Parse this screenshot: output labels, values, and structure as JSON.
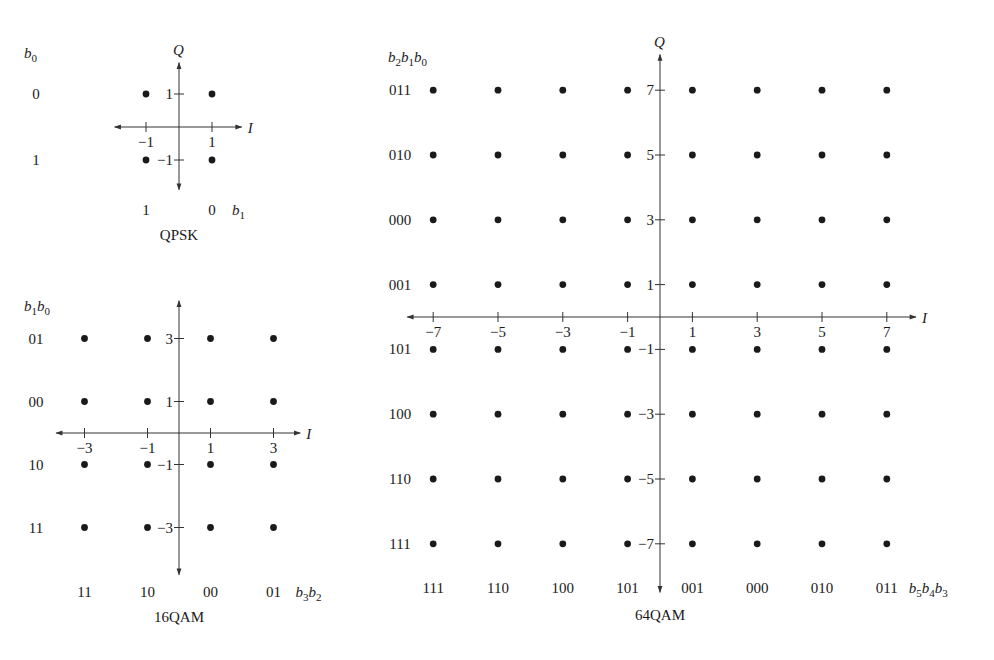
{
  "diagrams": [
    {
      "id": "qpsk",
      "title": "QPSK",
      "origin": [
        179,
        127
      ],
      "unit": 33,
      "x_range": [
        -1.95,
        1.9
      ],
      "y_range": [
        -1.9,
        1.95
      ],
      "x_axis_label": "I",
      "y_axis_label": "Q",
      "x_ticks": [
        -1,
        1
      ],
      "y_ticks": [
        1,
        -1
      ],
      "levels": [
        -1,
        1
      ],
      "row_header": "b0",
      "row_labels": [
        {
          "y": 1,
          "text": "0"
        },
        {
          "y": -1,
          "text": "1"
        }
      ],
      "row_label_x": 36,
      "col_header": "b1",
      "col_labels": [
        {
          "x": -1,
          "text": "1"
        },
        {
          "x": 1,
          "text": "0"
        }
      ],
      "col_label_y": 215,
      "title_y": 240
    },
    {
      "id": "16qam",
      "title": "16QAM",
      "origin": [
        179,
        433
      ],
      "unit": 31.5,
      "x_range": [
        -3.9,
        3.85
      ],
      "y_range": [
        -4.5,
        4.2
      ],
      "x_axis_label": "I",
      "y_axis_label": "",
      "x_ticks": [
        -3,
        -1,
        1,
        3
      ],
      "y_ticks": [
        3,
        1,
        -1,
        -3
      ],
      "levels": [
        -3,
        -1,
        1,
        3
      ],
      "row_header": "b1b0",
      "row_labels": [
        {
          "y": 3,
          "text": "01"
        },
        {
          "y": 1,
          "text": "00"
        },
        {
          "y": -1,
          "text": "10"
        },
        {
          "y": -3,
          "text": "11"
        }
      ],
      "row_label_x": 36,
      "col_header": "b3b2",
      "col_labels": [
        {
          "x": -3,
          "text": "11"
        },
        {
          "x": -1,
          "text": "10"
        },
        {
          "x": 1,
          "text": "00"
        },
        {
          "x": 3,
          "text": "01"
        }
      ],
      "col_label_y": 597,
      "title_y": 622
    },
    {
      "id": "64qam",
      "title": "64QAM",
      "origin": [
        660,
        317
      ],
      "unit": 32.4,
      "x_range": [
        -7.8,
        7.9
      ],
      "y_range": [
        -8.5,
        8.1
      ],
      "x_axis_label": "I",
      "y_axis_label": "Q",
      "x_ticks": [
        -7,
        -5,
        -3,
        -1,
        1,
        3,
        5,
        7
      ],
      "y_ticks": [
        7,
        5,
        3,
        1,
        -1,
        -3,
        -5,
        -7
      ],
      "levels": [
        -7,
        -5,
        -3,
        -1,
        1,
        3,
        5,
        7
      ],
      "row_header": "b2b1b0",
      "row_labels": [
        {
          "y": 7,
          "text": "011"
        },
        {
          "y": 5,
          "text": "010"
        },
        {
          "y": 3,
          "text": "000"
        },
        {
          "y": 1,
          "text": "001"
        },
        {
          "y": -1,
          "text": "101"
        },
        {
          "y": -3,
          "text": "100"
        },
        {
          "y": -5,
          "text": "110"
        },
        {
          "y": -7,
          "text": "111"
        }
      ],
      "row_label_x": 400,
      "col_header": "b5b4b3",
      "col_labels": [
        {
          "x": -7,
          "text": "111"
        },
        {
          "x": -5,
          "text": "110"
        },
        {
          "x": -3,
          "text": "100"
        },
        {
          "x": -1,
          "text": "101"
        },
        {
          "x": 1,
          "text": "001"
        },
        {
          "x": 3,
          "text": "000"
        },
        {
          "x": 5,
          "text": "010"
        },
        {
          "x": 7,
          "text": "011"
        }
      ],
      "col_label_y": 593,
      "title_y": 620
    }
  ]
}
